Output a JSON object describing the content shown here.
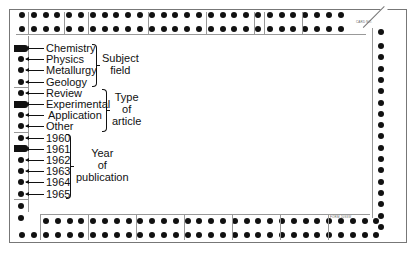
{
  "card": {
    "type": "edge-notched card",
    "notched_items": [
      "Chemistry",
      "Experimental",
      "1961"
    ]
  },
  "categories": [
    {
      "group_label_lines": [
        "Subject",
        "field"
      ],
      "items": [
        {
          "label": "Chemistry",
          "notched": true
        },
        {
          "label": "Physics",
          "notched": false
        },
        {
          "label": "Metallurgy",
          "notched": false
        },
        {
          "label": "Geology",
          "notched": false
        }
      ]
    },
    {
      "group_label_lines": [
        "Type",
        "of",
        "article"
      ],
      "items": [
        {
          "label": "Review",
          "notched": false
        },
        {
          "label": "Experimental",
          "notched": true
        },
        {
          "label": "Application",
          "notched": false
        },
        {
          "label": "Other",
          "notched": false
        }
      ]
    },
    {
      "group_label_lines": [
        "Year",
        "of",
        "publication"
      ],
      "items": [
        {
          "label": "1960",
          "notched": false
        },
        {
          "label": "1961",
          "notched": true
        },
        {
          "label": "1962",
          "notched": false
        },
        {
          "label": "1963",
          "notched": false
        },
        {
          "label": "1964",
          "notched": false
        },
        {
          "label": "1965",
          "notched": false
        }
      ]
    }
  ],
  "top_row_numbers": [
    "29",
    "28",
    "27",
    "26",
    "25",
    "24",
    "23",
    "22",
    "21",
    "20",
    "19",
    "18",
    "17",
    "16",
    "15",
    "14",
    "13",
    "12",
    "11",
    "10",
    "9",
    "8",
    "7",
    "6",
    "5",
    "4",
    "3",
    "2",
    "1"
  ],
  "bottom_footer_text": "FORM 2093W",
  "corner_text": "CARD NO."
}
